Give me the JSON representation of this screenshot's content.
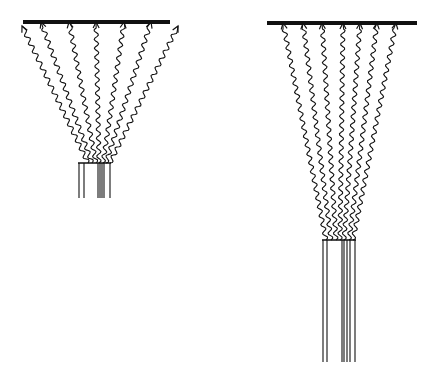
{
  "diagram": {
    "colors": {
      "ink": "#111111",
      "background": "#ffffff"
    },
    "panels": [
      {
        "id": "left",
        "screen": {
          "x1": 23,
          "x2": 170,
          "y": 22,
          "thickness": 4
        },
        "source": {
          "top_y": 163,
          "bottom_y": 198,
          "x_left": 78,
          "x_right": 111,
          "lines_x": [
            79,
            84,
            98,
            100,
            102,
            104,
            110
          ]
        },
        "rays": [
          {
            "from": [
              88,
              163
            ],
            "to": [
              22,
              26
            ]
          },
          {
            "from": [
              92,
              163
            ],
            "to": [
              41,
              22
            ]
          },
          {
            "from": [
              96,
              163
            ],
            "to": [
              69,
              22
            ]
          },
          {
            "from": [
              99,
              163
            ],
            "to": [
              96,
              22
            ]
          },
          {
            "from": [
              103,
              163
            ],
            "to": [
              124,
              22
            ]
          },
          {
            "from": [
              106,
              163
            ],
            "to": [
              151,
              22
            ]
          },
          {
            "from": [
              110,
              163
            ],
            "to": [
              178,
              26
            ]
          }
        ]
      },
      {
        "id": "right",
        "screen": {
          "x1": 267,
          "x2": 417,
          "y": 23,
          "thickness": 4
        },
        "source": {
          "top_y": 240,
          "bottom_y": 362,
          "x_left": 322,
          "x_right": 356,
          "lines_x": [
            323,
            327,
            342,
            344,
            347,
            350,
            355
          ]
        },
        "rays": [
          {
            "from": [
              326,
              240
            ],
            "to": [
              283,
              23
            ]
          },
          {
            "from": [
              331,
              240
            ],
            "to": [
              303,
              23
            ]
          },
          {
            "from": [
              336,
              240
            ],
            "to": [
              322,
              23
            ]
          },
          {
            "from": [
              340,
              240
            ],
            "to": [
              343,
              23
            ]
          },
          {
            "from": [
              344,
              240
            ],
            "to": [
              360,
              23
            ]
          },
          {
            "from": [
              349,
              240
            ],
            "to": [
              377,
              23
            ]
          },
          {
            "from": [
              353,
              240
            ],
            "to": [
              396,
              23
            ]
          }
        ]
      }
    ]
  }
}
